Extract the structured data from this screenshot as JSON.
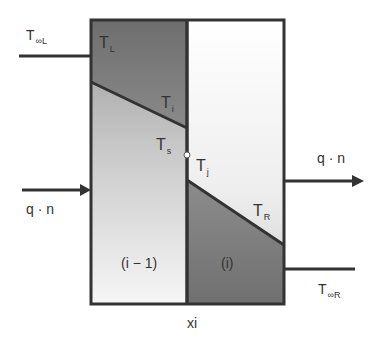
{
  "diagram": {
    "colors": {
      "outline": "#333333",
      "dark_fill": "#7a7a7a",
      "light_fill_top": "#a9a9a9",
      "light_fill_bottom": "#f4f4f4",
      "right_fill_top": "#ffffff",
      "right_fill_bottom": "#dcdcdc",
      "text": "#333333"
    },
    "labels": {
      "t_inf_left": {
        "main": "T",
        "sub": "∞L"
      },
      "t_left": {
        "main": "T",
        "sub": "L"
      },
      "t_i": {
        "main": "T",
        "sub": "i"
      },
      "t_s": {
        "main": "T",
        "sub": "s"
      },
      "t_j": {
        "main": "T",
        "sub": "j"
      },
      "t_right": {
        "main": "T",
        "sub": "R"
      },
      "t_inf_right": {
        "main": "T",
        "sub": "∞R"
      },
      "q_n_left": "q · n",
      "q_n_right": "q · n",
      "element_left": "(i − 1)",
      "element_right": "(i)",
      "interface": "xi"
    }
  }
}
